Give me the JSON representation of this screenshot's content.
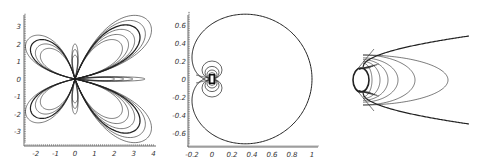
{
  "chart_data": [
    {
      "type": "line",
      "title": "",
      "description": "Family of four-lobed butterfly-shaped closed curves through the origin",
      "xlabel": "",
      "ylabel": "",
      "xlim": [
        -2.5,
        4
      ],
      "ylim": [
        -3.5,
        3.5
      ],
      "xticks": [
        "-2",
        "-1",
        "0",
        "1",
        "2",
        "3",
        "4"
      ],
      "yticks": [
        "3",
        "2",
        "1",
        "0",
        "-1",
        "-2",
        "-3"
      ],
      "grid": false,
      "series": [
        {
          "name": "upper-right lobes",
          "scale": [
            1.0,
            0.92,
            0.85,
            0.78,
            0.7,
            0.62
          ],
          "extent_x": 3.8,
          "extent_y": 3.4
        },
        {
          "name": "lower-right lobes",
          "scale": [
            1.0,
            0.92,
            0.85,
            0.78,
            0.7,
            0.62
          ],
          "extent_x": 3.8,
          "extent_y": -3.4
        },
        {
          "name": "upper-left lobes",
          "scale": [
            1.0,
            0.9,
            0.8,
            0.7
          ],
          "extent_x": -2.4,
          "extent_y": 2.2
        },
        {
          "name": "lower-left lobes",
          "scale": [
            1.0,
            0.9,
            0.8,
            0.7
          ],
          "extent_x": -2.4,
          "extent_y": -2.2
        },
        {
          "name": "vertical loops",
          "extent_y": [
            1.2,
            -1.2
          ]
        },
        {
          "name": "right-axis loops",
          "extent_x": 2.3
        }
      ]
    },
    {
      "type": "line",
      "title": "",
      "description": "Cardioid-like outer curve with nested dipole loops near origin",
      "xlabel": "",
      "ylabel": "",
      "xlim": [
        -0.2,
        1
      ],
      "ylim": [
        -0.72,
        0.72
      ],
      "xticks": [
        "-0.2",
        "0",
        "0.2",
        "0.4",
        "0.6",
        "0.8",
        "1"
      ],
      "yticks": [
        "0.6",
        "0.4",
        "0.2",
        "0",
        "-0.2",
        "-0.4",
        "-0.6"
      ],
      "grid": false,
      "series": [
        {
          "name": "outer cardioid",
          "x_range": [
            -0.2,
            1.0
          ],
          "y_range": [
            -0.72,
            0.72
          ]
        },
        {
          "name": "dipole loops",
          "radii": [
            0.1,
            0.07,
            0.05,
            0.035,
            0.02
          ]
        }
      ]
    },
    {
      "type": "line",
      "title": "",
      "description": "Circle with family of nested ellipses and bounding parabola; tangent lines at circle",
      "xlabel": "",
      "ylabel": "",
      "xticks": [],
      "yticks": [],
      "grid": false,
      "series": [
        {
          "name": "circle"
        },
        {
          "name": "ellipses",
          "count": 6
        },
        {
          "name": "parabola"
        },
        {
          "name": "tangent lines"
        }
      ]
    }
  ]
}
